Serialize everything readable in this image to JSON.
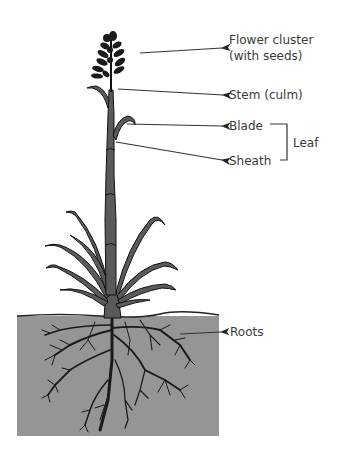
{
  "diagram": {
    "labels": {
      "flower_cluster": "Flower cluster",
      "flower_cluster_sub": "(with seeds)",
      "stem": "Stem (culm)",
      "blade": "Blade",
      "sheath": "Sheath",
      "leaf": "Leaf",
      "roots": "Roots"
    },
    "colors": {
      "soil": "#959595",
      "plant_fill": "#5a5a5a",
      "outline": "#111111",
      "text": "#3a3a3a",
      "arrow": "#333333"
    }
  }
}
